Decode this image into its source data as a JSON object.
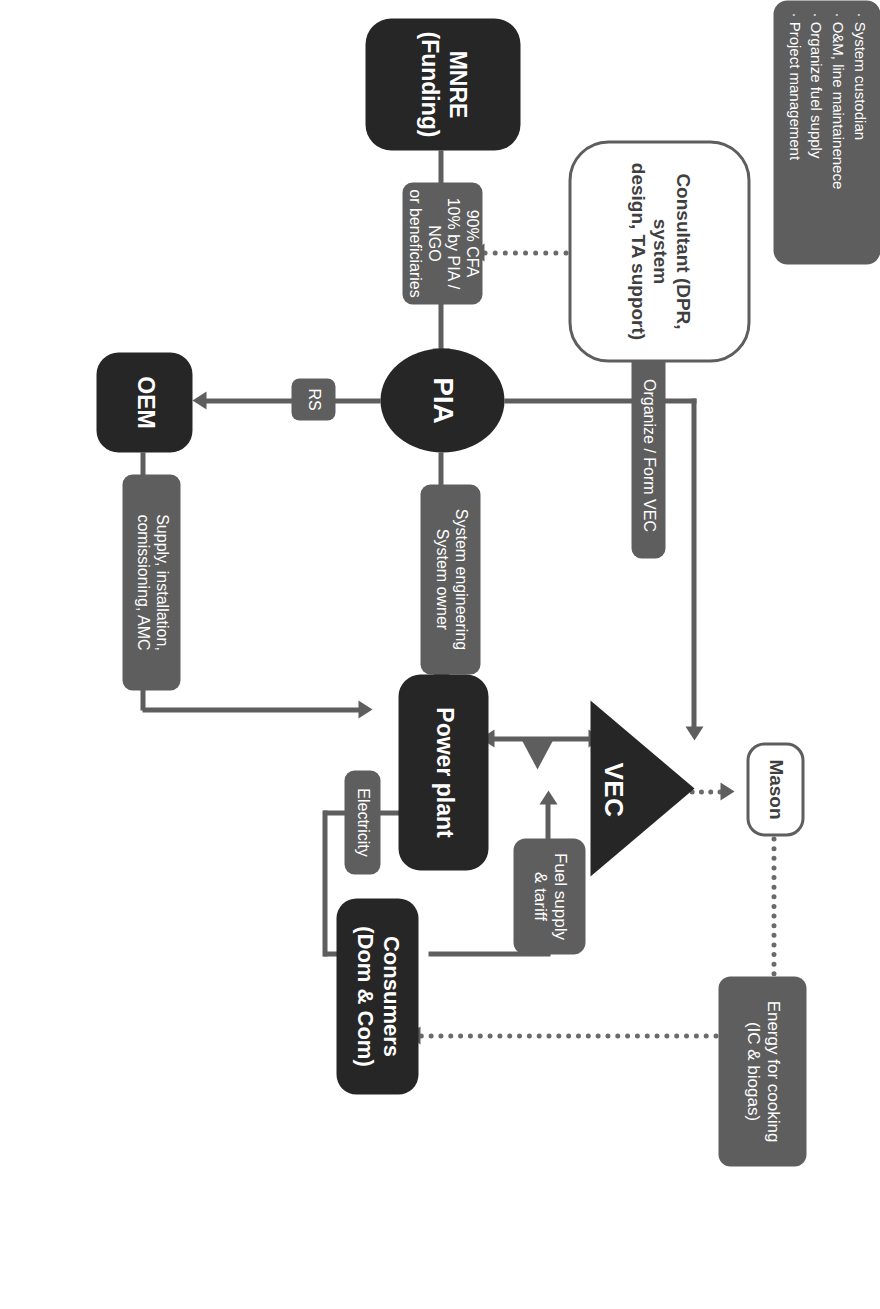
{
  "diagram": {
    "orientation": "rotated-90-clockwise",
    "colors": {
      "dark_node": "#262626",
      "gray_label": "#5e5e5e",
      "outline_node_border": "#5e5e5e",
      "connector": "#5e5e5e",
      "background": "#ffffff",
      "node_text": "#ffffff"
    },
    "nodes": {
      "mnre": "MNRE (Funding)",
      "pia": "PIA",
      "oem": "OEM",
      "power_plant": "Power plant",
      "vec": "VEC",
      "mason": "Mason",
      "consumers": "Consumers\n(Dom & Com)",
      "consultant": "Consultant (DPR, system design, TA support)"
    },
    "node_text": {
      "mnre": "MNRE (Funding)",
      "pia": "PIA",
      "oem": "OEM",
      "power_plant": "Power plant",
      "vec": "VEC",
      "mason": "Mason",
      "consumers_line1": "Consumers",
      "consumers_line2": "(Dom & Com)",
      "consultant_line1": "Consultant (DPR, system",
      "consultant_line2": "design, TA support)"
    },
    "edge_labels": {
      "funding": {
        "line1": "90% CFA",
        "line2": "10% by PIA / NGO",
        "line3": "or beneficiaries"
      },
      "rs": "RS",
      "system_engineering": {
        "line1": "System engineering",
        "line2": "System owner"
      },
      "organize_form_vec": "Organize / Form VEC",
      "supply_install": {
        "line1": "Supply, installation,",
        "line2": "comissioning, AMC"
      },
      "electricity": "Electricity",
      "fuel_supply_tariff": {
        "line1": "Fuel supply",
        "line2": "& tariff"
      },
      "energy_for_cooking": {
        "line1": "Energy for cooking",
        "line2": "(IC & biogas)"
      }
    },
    "callout": {
      "items": [
        "System custodian",
        "O&M, line maintainenece",
        "Organize fuel supply",
        "Project management"
      ]
    }
  }
}
